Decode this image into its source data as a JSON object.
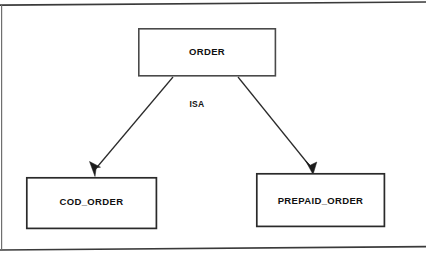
{
  "diagram": {
    "type": "er-isa-hierarchy",
    "relationship_label": "ISA",
    "supertype": {
      "name": "ORDER",
      "label": "ORDER",
      "box": {
        "x": 138,
        "y": 28,
        "w": 138,
        "h": 48
      }
    },
    "subtypes": [
      {
        "name": "COD_ORDER",
        "label": "COD_ORDER",
        "box": {
          "x": 26,
          "y": 177,
          "w": 131,
          "h": 52
        }
      },
      {
        "name": "PREPAID_ORDER",
        "label": "PREPAID_ORDER",
        "box": {
          "x": 256,
          "y": 173,
          "w": 129,
          "h": 54
        }
      }
    ],
    "edges": [
      {
        "from": "ORDER",
        "to": "COD_ORDER",
        "arrow": "to-subtype"
      },
      {
        "from": "ORDER",
        "to": "PREPAID_ORDER",
        "arrow": "to-subtype"
      }
    ],
    "colors": {
      "background": "#ffffff",
      "box_stroke": "#4a4a4a",
      "edge_stroke": "#2b2b2b",
      "text": "#101010",
      "rule": "#3a3a3a"
    }
  }
}
